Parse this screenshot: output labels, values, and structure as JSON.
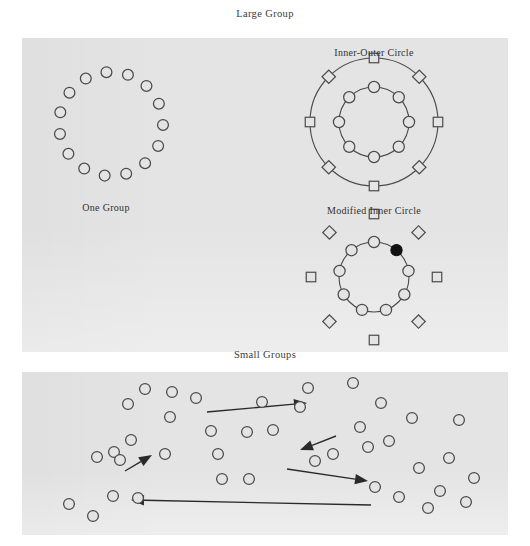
{
  "figure": {
    "top_title": "Large Group",
    "bottom_title": "Small Groups"
  },
  "panels": {
    "large_group": {
      "name": "Large Group",
      "background_color": "#e4e4e4",
      "sub_diagrams": {
        "one_group": {
          "label": "One Group",
          "label_x": 106,
          "label_y": 202,
          "node_count": 15,
          "shape": "circle",
          "node_fill": "#e4e4e4",
          "node_stroke": "#4a4a4a",
          "connector": "none",
          "center_x": 111,
          "center_y": 124,
          "radius": 52,
          "node_radius": 5.4,
          "start_angle_deg": -95
        },
        "inner_outer_circle": {
          "label": "Inner-Outer Circle",
          "label_x": 374,
          "label_y": 47,
          "outer": {
            "count": 8,
            "shape": "square",
            "alternating_rotation_deg": 45,
            "radius": 64,
            "size": 9.5,
            "ring_line": true
          },
          "inner": {
            "count": 8,
            "shape": "circle",
            "radius": 35,
            "node_radius": 5.6,
            "ring_line": true
          },
          "center_x": 374,
          "center_y": 122
        },
        "modified_inner_circle": {
          "label": "Modified Inner Circle",
          "label_x": 374,
          "label_y": 205,
          "outer": {
            "count": 8,
            "shape": "square",
            "alternating_rotation_deg": 45,
            "radius": 63,
            "size": 9.5,
            "ring_line": false
          },
          "inner": {
            "count": 9,
            "shape": "circle",
            "radius": 35,
            "node_radius": 5.6,
            "ring_line": true,
            "filled_index": 1,
            "filled_color": "#111111"
          },
          "center_x": 374,
          "center_y": 277
        }
      }
    },
    "small_groups": {
      "name": "Small Groups",
      "background_color": "#e4e4e4",
      "node_shape": "circle",
      "node_radius": 5.4,
      "node_fill": "#e4e4e4",
      "node_stroke": "#4a4a4a",
      "nodes": [
        [
          145,
          389
        ],
        [
          172,
          392
        ],
        [
          128,
          404
        ],
        [
          196,
          398
        ],
        [
          131,
          440
        ],
        [
          170,
          417
        ],
        [
          114,
          452
        ],
        [
          120,
          460
        ],
        [
          97,
          457
        ],
        [
          165,
          454
        ],
        [
          113,
          496
        ],
        [
          138,
          498
        ],
        [
          69,
          504
        ],
        [
          93,
          516
        ],
        [
          211,
          431
        ],
        [
          218,
          454
        ],
        [
          222,
          479
        ],
        [
          247,
          432
        ],
        [
          249,
          479
        ],
        [
          262,
          402
        ],
        [
          273,
          430
        ],
        [
          300,
          407
        ],
        [
          308,
          388
        ],
        [
          315,
          461
        ],
        [
          333,
          454
        ],
        [
          353,
          383
        ],
        [
          360,
          427
        ],
        [
          368,
          447
        ],
        [
          375,
          487
        ],
        [
          381,
          403
        ],
        [
          389,
          441
        ],
        [
          399,
          497
        ],
        [
          412,
          418
        ],
        [
          419,
          468
        ],
        [
          428,
          508
        ],
        [
          440,
          491
        ],
        [
          449,
          458
        ],
        [
          459,
          420
        ],
        [
          466,
          502
        ],
        [
          474,
          478
        ]
      ],
      "arrows": [
        {
          "name": "arrow-left-short-up",
          "x1": 125,
          "y1": 471,
          "x2": 152,
          "y2": 455
        },
        {
          "name": "arrow-long-right-top",
          "x1": 207,
          "y1": 412,
          "x2": 307,
          "y2": 403
        },
        {
          "name": "arrow-short-down-left",
          "x1": 336,
          "y1": 436,
          "x2": 300,
          "y2": 450
        },
        {
          "name": "arrow-mid-right-down",
          "x1": 287,
          "y1": 469,
          "x2": 368,
          "y2": 481
        },
        {
          "name": "arrow-long-left-bottom",
          "x1": 371,
          "y1": 505,
          "x2": 131,
          "y2": 500
        }
      ]
    }
  }
}
